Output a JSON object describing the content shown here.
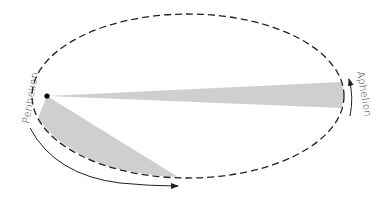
{
  "diagram": {
    "labels": {
      "perihelion": "Perihelion",
      "aphelion": "Aphelion"
    },
    "colors": {
      "orbit": "#222222",
      "wedge": "#cfcfcf",
      "sun": "#000000",
      "arrow": "#222222"
    },
    "orbit": {
      "cx": 188,
      "cy": 96,
      "rx": 156,
      "ry": 82,
      "style": "dashed"
    },
    "sun": {
      "x": 47,
      "y": 96,
      "r": 2.6
    },
    "wedges": [
      {
        "name": "aphelion-wedge",
        "points": "47,96 342,82 343,95 342,108"
      },
      {
        "name": "perihelion-wedge",
        "points": "47,96 38,118 55,140 80,156 110,167 145,174 178,177"
      }
    ]
  }
}
